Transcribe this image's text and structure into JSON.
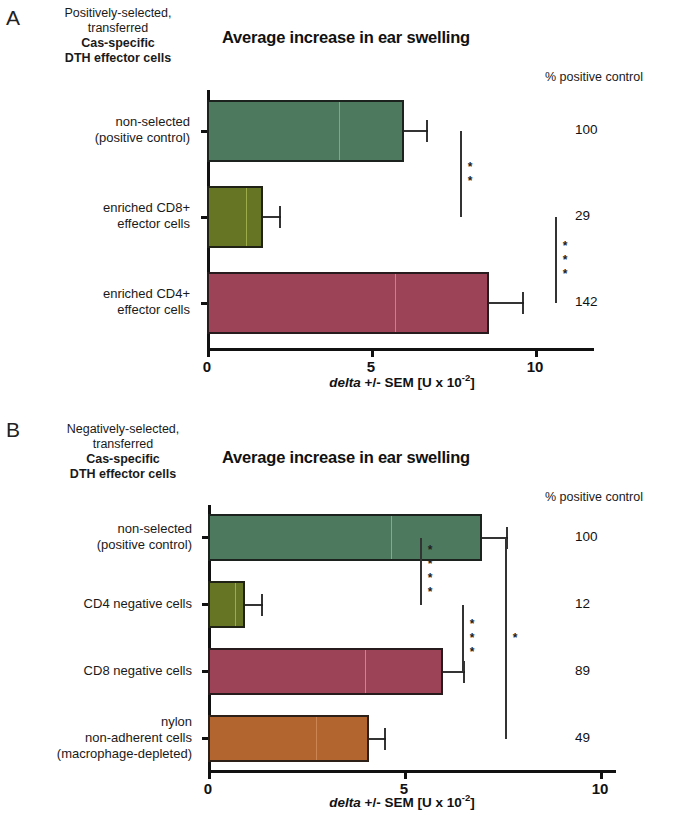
{
  "figure": {
    "axis_caption_pre": "delta",
    "axis_caption_mid": " +/- SEM [U x 10",
    "axis_caption_sup": "-2",
    "axis_caption_post": "]"
  },
  "panels": [
    {
      "letter": "A",
      "group_caption": {
        "line1": "Positively-selected,",
        "line2": "transferred",
        "line3": "Cas-specific",
        "line4": "DTH effector cells"
      },
      "title": "Average increase in ear swelling",
      "pct_header": "% positive control",
      "axis": {
        "ticks": [
          "0",
          "5",
          "10"
        ],
        "tick_values": [
          0,
          5,
          10
        ],
        "xmax": 11.8
      },
      "categories": [
        {
          "line1": "non-selected",
          "line2": "(positive control)"
        },
        {
          "line1": "enriched CD8+",
          "line2": "effector cells"
        },
        {
          "line1": "enriched CD4+",
          "line2": "effector cells"
        }
      ],
      "values": [
        6.0,
        1.7,
        8.6
      ],
      "errors": [
        0.75,
        0.55,
        1.05
      ],
      "pct_values": [
        "100",
        "29",
        "142"
      ],
      "colors": [
        "#4d7a5e",
        "#667524",
        "#9c4358"
      ],
      "seam_colors": [
        "#9fd4a8",
        "#c8d86a",
        "#ffb28a"
      ],
      "significance": [
        {
          "label": "**",
          "from": 0,
          "to": 1
        },
        {
          "label": "***",
          "from": 1,
          "to": 2
        }
      ]
    },
    {
      "letter": "B",
      "group_caption": {
        "line1": "Negatively-selected,",
        "line2": "transferred",
        "line3": "Cas-specific",
        "line4": "DTH effector cells"
      },
      "title": "Average increase in ear swelling",
      "pct_header": "% positive control",
      "axis": {
        "ticks": [
          "0",
          "5",
          "10"
        ],
        "tick_values": [
          0,
          5,
          10
        ],
        "xmax": 10.4
      },
      "categories": [
        {
          "line1": "non-selected",
          "line2": "(positive control)"
        },
        {
          "line1": "CD4 negative cells",
          "line2": ""
        },
        {
          "line1": "CD8 negative cells",
          "line2": ""
        },
        {
          "line1": "nylon",
          "line2": "non-adherent cells",
          "line3": "(macrophage-depleted)"
        }
      ],
      "values": [
        7.0,
        0.95,
        6.0,
        4.1
      ],
      "errors": [
        0.65,
        0.45,
        0.55,
        0.45
      ],
      "pct_values": [
        "100",
        "12",
        "89",
        "49"
      ],
      "colors": [
        "#4d7a5e",
        "#667524",
        "#9c4358",
        "#b36530"
      ],
      "seam_colors": [
        "#9fe0a0",
        "#c8d86a",
        "#ffc08a",
        "#e0a070"
      ],
      "significance": [
        {
          "label": "****",
          "from": 0,
          "to": 1
        },
        {
          "label": "***",
          "from": 1,
          "to": 2
        },
        {
          "label": "*",
          "from": 0,
          "to": 3
        }
      ]
    }
  ]
}
